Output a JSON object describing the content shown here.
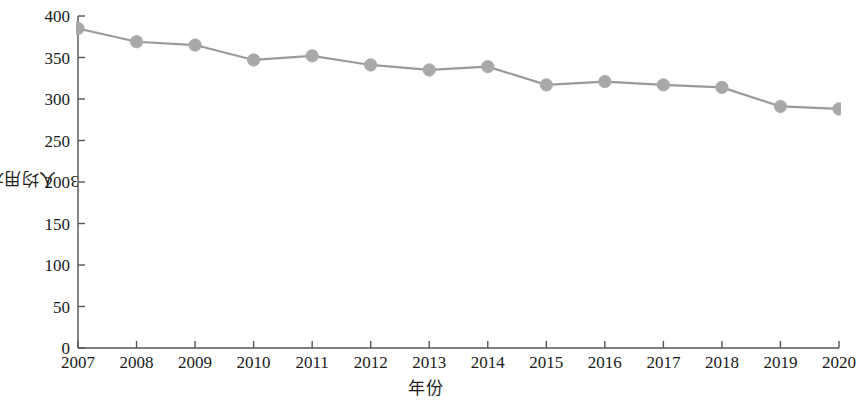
{
  "chart_data": {
    "type": "line",
    "title": "",
    "subtitle": "",
    "xlabel": "年份",
    "ylabel": "人均用水量/m³",
    "ylabel_main": "人均用水量/m",
    "ylabel_sup": "3",
    "categories": [
      "2007",
      "2008",
      "2009",
      "2010",
      "2011",
      "2012",
      "2013",
      "2014",
      "2015",
      "2016",
      "2017",
      "2018",
      "2019",
      "2020"
    ],
    "x": [
      2007,
      2008,
      2009,
      2010,
      2011,
      2012,
      2013,
      2014,
      2015,
      2016,
      2017,
      2018,
      2019,
      2020
    ],
    "values": [
      385,
      369,
      365,
      347,
      352,
      341,
      335,
      339,
      317,
      321,
      317,
      314,
      291,
      288
    ],
    "series": [
      {
        "name": "人均用水量",
        "values": [
          385,
          369,
          365,
          347,
          352,
          341,
          335,
          339,
          317,
          321,
          317,
          314,
          291,
          288
        ]
      }
    ],
    "ylim": [
      0,
      400
    ],
    "yticks": [
      0,
      50,
      100,
      150,
      200,
      250,
      300,
      350,
      400
    ],
    "ytick_labels": [
      "0",
      "50",
      "100",
      "150",
      "200",
      "250",
      "300",
      "350",
      "400"
    ],
    "xlim": [
      2007,
      2020
    ],
    "grid": false,
    "legend": false,
    "legend_position": "none",
    "marker": "circle",
    "line_color": "#9a9a9a",
    "marker_color": "#a8a8a8",
    "axis_color": "#555555"
  }
}
